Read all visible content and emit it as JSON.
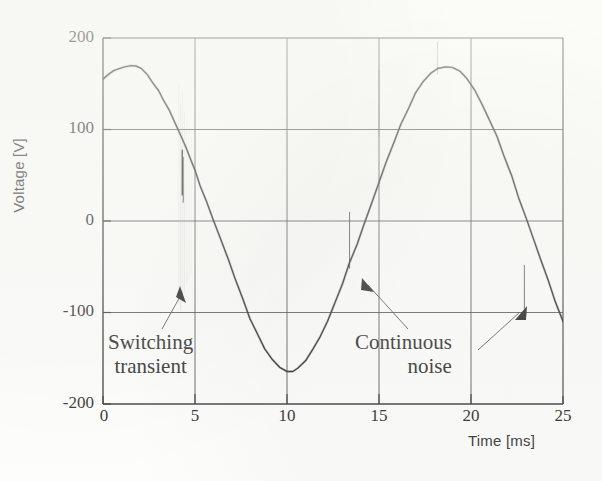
{
  "figure": {
    "kind": "oscilloscope-waveform-figure",
    "background_color": "#fdfdfb",
    "trace_color": "#2a2a2a",
    "axis_color": "#3b3b3b",
    "noise_color": "#9a9a9a"
  },
  "axes": {
    "x_title": "Time [ms]",
    "y_title": "Voltage [V]",
    "x_ticks": [
      "0",
      "5",
      "10",
      "15",
      "20",
      "25"
    ],
    "y_ticks": [
      "200",
      "100",
      "0",
      "-100",
      "-200"
    ]
  },
  "annotations": [
    {
      "id": "switching",
      "line1": "Switching",
      "line2": "transient"
    },
    {
      "id": "noise",
      "line1": "Continuous",
      "line2": "noise"
    }
  ],
  "chart_data": {
    "type": "line",
    "title": "",
    "xlabel": "Time [ms]",
    "ylabel": "Voltage [V]",
    "xlim": [
      0,
      25
    ],
    "ylim": [
      -200,
      200
    ],
    "xticks": [
      0,
      5,
      10,
      15,
      20,
      25
    ],
    "yticks": [
      -200,
      -100,
      0,
      100,
      200
    ],
    "grid": true,
    "legend": null,
    "series": [
      {
        "name": "Mains voltage with switching transient and continuous noise",
        "x": [
          0.0,
          0.3,
          0.6,
          0.9,
          1.2,
          1.5,
          1.8,
          2.1,
          2.4,
          2.7,
          3.0,
          3.3,
          3.6,
          3.9,
          4.2,
          4.5,
          4.8,
          5.0,
          5.3,
          5.6,
          6.0,
          6.4,
          6.8,
          7.2,
          7.6,
          8.0,
          8.4,
          8.8,
          9.2,
          9.6,
          10.0,
          10.3,
          10.6,
          11.0,
          11.4,
          11.8,
          12.2,
          12.6,
          13.0,
          13.4,
          13.8,
          14.2,
          14.6,
          15.0,
          15.4,
          15.8,
          16.2,
          16.6,
          17.0,
          17.4,
          17.8,
          18.2,
          18.6,
          19.0,
          19.4,
          19.8,
          20.2,
          20.6,
          21.0,
          21.4,
          21.8,
          22.2,
          22.6,
          23.0,
          23.4,
          23.8,
          24.2,
          24.6,
          25.0
        ],
        "y": [
          155,
          160,
          164,
          167,
          169,
          170,
          169,
          166,
          160,
          152,
          143,
          132,
          120,
          108,
          95,
          81,
          66,
          54,
          38,
          22,
          2,
          -20,
          -42,
          -64,
          -86,
          -106,
          -124,
          -140,
          -152,
          -160,
          -164,
          -164,
          -161,
          -153,
          -141,
          -126,
          -109,
          -90,
          -69,
          -47,
          -25,
          -3,
          20,
          42,
          64,
          86,
          106,
          124,
          140,
          152,
          161,
          167,
          169,
          168,
          163,
          155,
          143,
          128,
          111,
          92,
          71,
          49,
          26,
          3,
          -20,
          -43,
          -66,
          -88,
          -110
        ],
        "color": "#2a2a2a",
        "linewidth": 1.4
      }
    ],
    "events": [
      {
        "type": "switching_transient",
        "label": "Switching transient",
        "x_center_ms": 4.3,
        "x_range_ms": [
          4.1,
          4.9
        ],
        "y_range_v": [
          -100,
          145
        ],
        "description": "Cluster of faint vertical spike lines with one dark dense spike near the zero crossing"
      },
      {
        "type": "continuous_noise",
        "label": "Continuous noise",
        "spikes_ms": [
          13.4,
          15.0,
          18.2,
          22.9
        ],
        "y_amplitude_v": [
          30,
          90
        ],
        "description": "Isolated thin vertical noise spikes riding on the waveform"
      }
    ],
    "annotation_arrows": [
      {
        "label": "Switching transient",
        "points_to_ms": 4.4,
        "points_to_v": -78
      },
      {
        "label": "Continuous noise",
        "points_to_ms": 13.5,
        "points_to_v": -82
      },
      {
        "label": "Continuous noise",
        "points_to_ms": 22.9,
        "points_to_v": -97
      }
    ]
  }
}
